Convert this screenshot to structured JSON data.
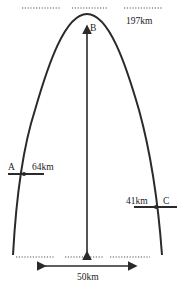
{
  "diagram": {
    "type": "parabolic-trajectory",
    "colors": {
      "stroke": "#2a2a2a",
      "dots": "#555555",
      "text": "#222222"
    },
    "points": {
      "A": {
        "label": "A",
        "altitude": "64km"
      },
      "B": {
        "label": "B"
      },
      "C": {
        "label": "C",
        "altitude": "41km"
      }
    },
    "peak_altitude": "197km",
    "base_width": "50km"
  }
}
